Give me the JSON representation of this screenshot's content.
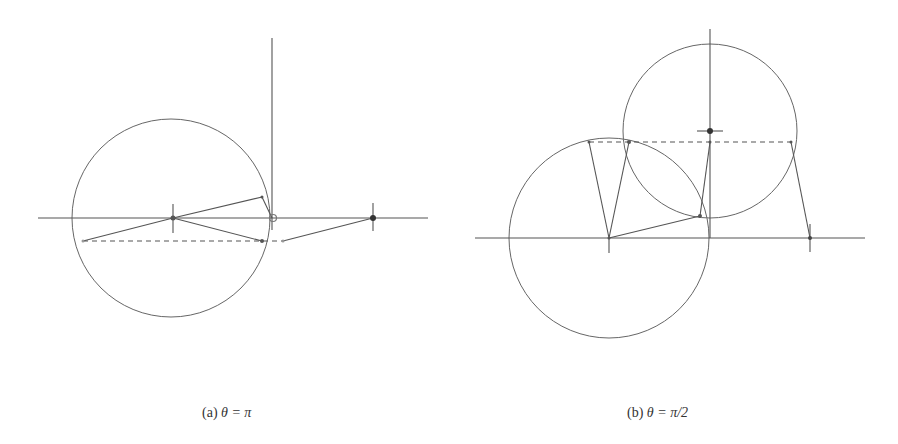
{
  "figure": {
    "stroke_color": "#555555",
    "light_color": "#999999",
    "subfigures": [
      {
        "id": "a",
        "caption": {
          "label": "(a)",
          "math": "θ = π"
        },
        "lines": [
          {
            "name": "horizontal-axis",
            "x1": 38,
            "y1": 218,
            "x2": 428,
            "y2": 218
          },
          {
            "name": "vertical-axis",
            "x1": 272,
            "y1": 38,
            "x2": 272,
            "y2": 230
          },
          {
            "name": "center-cross-tick",
            "x1": 173,
            "y1": 204,
            "x2": 173,
            "y2": 233
          },
          {
            "name": "right-cross-tick",
            "x1": 373,
            "y1": 203,
            "x2": 373,
            "y2": 231
          },
          {
            "name": "link-center-to-upper",
            "x1": 173,
            "y1": 218,
            "x2": 262,
            "y2": 197
          },
          {
            "name": "link-upper-to-pivot",
            "x1": 262,
            "y1": 197,
            "x2": 272,
            "y2": 218
          },
          {
            "name": "link-center-to-lower",
            "x1": 173,
            "y1": 218,
            "x2": 262,
            "y2": 241
          },
          {
            "name": "link-left-to-center",
            "x1": 83,
            "y1": 241,
            "x2": 173,
            "y2": 218
          },
          {
            "name": "link-grey-to-right",
            "x1": 283,
            "y1": 241,
            "x2": 373,
            "y2": 218
          }
        ],
        "dashed": [
          {
            "name": "dashed-chord",
            "x1": 83,
            "y1": 241,
            "x2": 283,
            "y2": 241
          }
        ],
        "circles": [
          {
            "name": "main-circle",
            "cx": 171,
            "cy": 218,
            "r": 99
          }
        ],
        "points": [
          {
            "name": "center-point",
            "cx": 173,
            "cy": 218,
            "r": 2.5,
            "fill": "#555555"
          },
          {
            "name": "upper-point",
            "cx": 262,
            "cy": 197,
            "r": 1.5,
            "fill": "#555555"
          },
          {
            "name": "lower-point",
            "cx": 262,
            "cy": 241,
            "r": 2,
            "fill": "#555555"
          },
          {
            "name": "left-point",
            "cx": 83,
            "cy": 241,
            "r": 1.5,
            "fill": "#999999"
          },
          {
            "name": "grey-point",
            "cx": 283,
            "cy": 241,
            "r": 1.5,
            "fill": "#999999"
          },
          {
            "name": "right-point",
            "cx": 373,
            "cy": 218,
            "r": 3,
            "fill": "#333333"
          }
        ],
        "open_points": [
          {
            "name": "pivot-open-circle",
            "cx": 273,
            "cy": 218,
            "r": 3.5
          }
        ]
      },
      {
        "id": "b",
        "caption": {
          "label": "(b)",
          "math": "θ = π/2"
        },
        "lines": [
          {
            "name": "horizontal-axis",
            "x1": 475,
            "y1": 238,
            "x2": 865,
            "y2": 238
          },
          {
            "name": "vertical-axis",
            "x1": 710,
            "y1": 29,
            "x2": 710,
            "y2": 238
          },
          {
            "name": "upper-center-tick",
            "x1": 697,
            "y1": 131,
            "x2": 723,
            "y2": 131
          },
          {
            "name": "lower-center-cross-tick",
            "x1": 609,
            "y1": 238,
            "x2": 609,
            "y2": 253
          },
          {
            "name": "right-cross-tick",
            "x1": 810,
            "y1": 224,
            "x2": 810,
            "y2": 252
          },
          {
            "name": "link-left-chord-to-center",
            "x1": 589,
            "y1": 142,
            "x2": 609,
            "y2": 238
          },
          {
            "name": "link-center-to-intersection",
            "x1": 609,
            "y1": 238,
            "x2": 629,
            "y2": 142
          },
          {
            "name": "link-center-to-lower-intersection",
            "x1": 609,
            "y1": 238,
            "x2": 700,
            "y2": 216
          },
          {
            "name": "link-lower-intersection-to-axis-point",
            "x1": 700,
            "y1": 216,
            "x2": 710,
            "y2": 142
          },
          {
            "name": "link-right-chord-to-right-point",
            "x1": 791,
            "y1": 142,
            "x2": 810,
            "y2": 238
          }
        ],
        "dashed": [
          {
            "name": "dashed-chord",
            "x1": 589,
            "y1": 142,
            "x2": 791,
            "y2": 142
          }
        ],
        "circles": [
          {
            "name": "lower-circle",
            "cx": 609,
            "cy": 238,
            "r": 100
          },
          {
            "name": "upper-circle",
            "cx": 710,
            "cy": 131,
            "r": 87
          }
        ],
        "points": [
          {
            "name": "upper-center-point",
            "cx": 710,
            "cy": 131,
            "r": 3,
            "fill": "#333333"
          },
          {
            "name": "lower-center-point",
            "cx": 609,
            "cy": 238,
            "r": 1.5,
            "fill": "#555555"
          },
          {
            "name": "left-chord-point",
            "cx": 589,
            "cy": 142,
            "r": 1.5,
            "fill": "#555555"
          },
          {
            "name": "intersection-point",
            "cx": 629,
            "cy": 142,
            "r": 2,
            "fill": "#555555"
          },
          {
            "name": "axis-chord-point",
            "cx": 710,
            "cy": 142,
            "r": 1.5,
            "fill": "#555555"
          },
          {
            "name": "lower-intersection-point",
            "cx": 700,
            "cy": 216,
            "r": 2,
            "fill": "#555555"
          },
          {
            "name": "right-chord-point",
            "cx": 791,
            "cy": 142,
            "r": 1.5,
            "fill": "#555555"
          },
          {
            "name": "right-axis-point",
            "cx": 810,
            "cy": 238,
            "r": 2,
            "fill": "#444444"
          }
        ],
        "open_points": []
      }
    ]
  }
}
